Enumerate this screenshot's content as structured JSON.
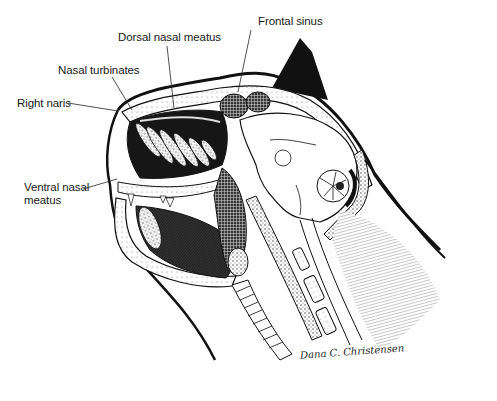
{
  "figure": {
    "style": "black-and-white stippled pen illustration",
    "colors": {
      "ink": "#111111",
      "background": "#ffffff",
      "label_text": "#1a1a1a"
    }
  },
  "labels": [
    {
      "id": "frontal-sinus",
      "text": "Frontal sinus",
      "x": 258,
      "y": 15,
      "leader": {
        "x1": 251,
        "y1": 30,
        "x2": 238,
        "y2": 92
      }
    },
    {
      "id": "dorsal-nasal-meatus",
      "text": "Dorsal nasal meatus",
      "x": 118,
      "y": 31,
      "leader": {
        "x1": 167,
        "y1": 46,
        "x2": 174,
        "y2": 108
      }
    },
    {
      "id": "nasal-turbinates",
      "text": "Nasal turbinates",
      "x": 58,
      "y": 64,
      "leader": {
        "x1": 112,
        "y1": 77,
        "x2": 132,
        "y2": 110
      }
    },
    {
      "id": "right-naris",
      "text": "Right naris",
      "x": 17,
      "y": 97,
      "leader": {
        "x1": 68,
        "y1": 103,
        "x2": 118,
        "y2": 111
      }
    },
    {
      "id": "ventral-nasal-meatus",
      "lines": [
        "Ventral nasal",
        "meatus"
      ],
      "x": 24,
      "y": 181,
      "leader": {
        "x1": 83,
        "y1": 189,
        "x2": 117,
        "y2": 179
      }
    }
  ],
  "signature": {
    "text": "Dana C. Christensen",
    "x": 300,
    "y": 346
  }
}
